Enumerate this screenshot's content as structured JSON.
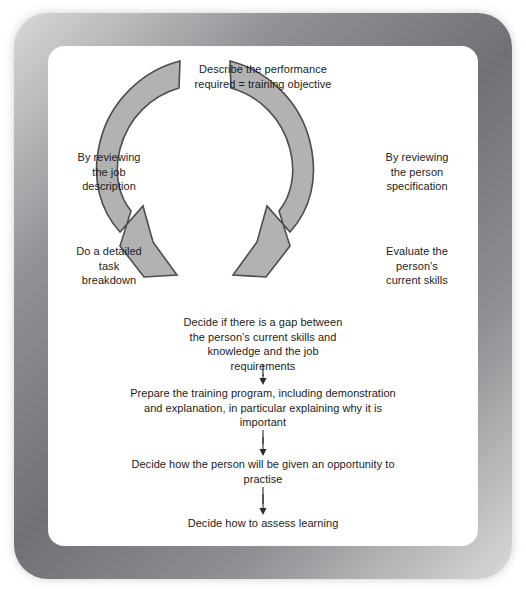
{
  "diagram": {
    "title_node": "Describe the performance\nrequired = training objective",
    "left_labels": [
      "By reviewing\nthe job\ndescription",
      "Do a detailed\ntask\nbreakdown"
    ],
    "right_labels": [
      "By reviewing\nthe person\nspecification",
      "Evaluate the\nperson’s\ncurrent skills"
    ],
    "flow_nodes": [
      "Decide if there is a gap between\nthe person’s current skills and\nknowledge and the job\nrequirements",
      "Prepare the training program, including demonstration\nand explanation, in particular explaining why it is\nimportant",
      "Decide how the person will be given an opportunity to\npractise",
      "Decide how to assess learning"
    ],
    "cycle_arrows": {
      "left_arrow_name": "curved-arrow-left",
      "right_arrow_name": "curved-arrow-right"
    },
    "colors": {
      "arrow_fill": "#b2b2b2",
      "arrow_stroke": "#4d4d4d",
      "connector": "#2b2b2b",
      "frame": "#76787c",
      "page": "#ffffff",
      "text": "#1c1c1c"
    }
  }
}
